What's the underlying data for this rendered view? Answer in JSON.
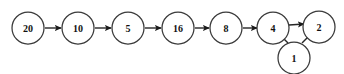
{
  "diagram": {
    "type": "directed-graph",
    "canvas": {
      "width": 344,
      "height": 74,
      "background": "#ffffff"
    },
    "style": {
      "node_fill": "#ffffff",
      "node_stroke": "#3a3a3a",
      "label_color": "#111111",
      "edge_color": "#262626",
      "arrowhead_color": "#1a1a1a",
      "node_radius": 16
    },
    "nodes": [
      {
        "id": "n20",
        "label": "20",
        "cx": 28,
        "cy": 28,
        "r": 16
      },
      {
        "id": "n10",
        "label": "10",
        "cx": 78,
        "cy": 28,
        "r": 16
      },
      {
        "id": "n5",
        "label": "5",
        "cx": 128,
        "cy": 28,
        "r": 16
      },
      {
        "id": "n16",
        "label": "16",
        "cx": 178,
        "cy": 28,
        "r": 16
      },
      {
        "id": "n8",
        "label": "8",
        "cx": 226,
        "cy": 28,
        "r": 16
      },
      {
        "id": "n4",
        "label": "4",
        "cx": 273,
        "cy": 28,
        "r": 16
      },
      {
        "id": "n2",
        "label": "2",
        "cx": 319,
        "cy": 27,
        "r": 16
      },
      {
        "id": "n1",
        "label": "1",
        "cx": 294,
        "cy": 58,
        "r": 16
      }
    ],
    "edges": [
      {
        "id": "e1",
        "from": "20",
        "to": "10",
        "x1": 45,
        "y1": 28,
        "x2": 61,
        "y2": 28
      },
      {
        "id": "e2",
        "from": "10",
        "to": "5",
        "x1": 95,
        "y1": 28,
        "x2": 111,
        "y2": 28
      },
      {
        "id": "e3",
        "from": "5",
        "to": "16",
        "x1": 145,
        "y1": 28,
        "x2": 161,
        "y2": 28
      },
      {
        "id": "e4",
        "from": "16",
        "to": "8",
        "x1": 195,
        "y1": 28,
        "x2": 209,
        "y2": 28
      },
      {
        "id": "e5",
        "from": "8",
        "to": "4",
        "x1": 243,
        "y1": 28,
        "x2": 256,
        "y2": 28
      },
      {
        "id": "e6",
        "from": "4",
        "to": "2",
        "x1": 290,
        "y1": 26,
        "x2": 303,
        "y2": 25
      },
      {
        "id": "e7",
        "from": "1",
        "to": "4",
        "x1": 287,
        "y1": 43,
        "x2": 278,
        "y2": 34
      },
      {
        "id": "e8",
        "from": "1",
        "to": "2",
        "x1": 302,
        "y1": 43,
        "x2": 311,
        "y2": 34
      }
    ],
    "sequence": [
      "20",
      "10",
      "5",
      "16",
      "8",
      "4",
      "2"
    ],
    "extra_node": "1"
  }
}
